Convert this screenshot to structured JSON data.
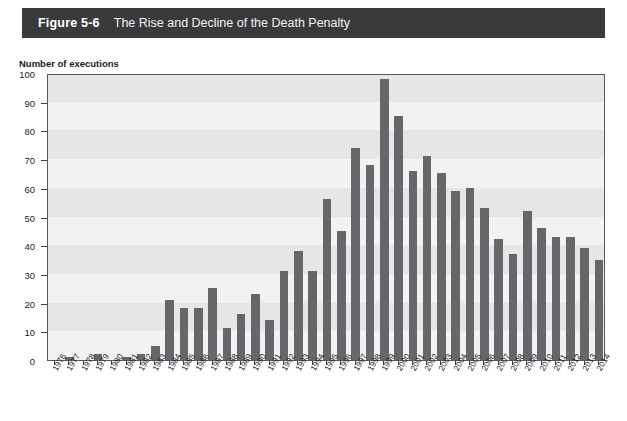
{
  "header": {
    "figure_number": "Figure 5-6",
    "title": "The Rise and Decline of the Death Penalty",
    "bar_color": "#3a3a3c",
    "text_color": "#ffffff"
  },
  "chart_data": {
    "type": "bar",
    "title": "The Rise and Decline of the Death Penalty",
    "xlabel": "",
    "ylabel": "Number of executions",
    "ylim": [
      0,
      100
    ],
    "ytick_step": 10,
    "yticks": [
      0,
      10,
      20,
      30,
      40,
      50,
      60,
      70,
      80,
      90,
      100
    ],
    "grid": false,
    "legend": null,
    "bar_color": "#66666b",
    "plot_background": "#f2f2f2",
    "band_color": "#e6e6e6",
    "categories": [
      "1976",
      "1977",
      "1978",
      "1979",
      "1980",
      "1981",
      "1982",
      "1983",
      "1984",
      "1985",
      "1986",
      "1987",
      "1988",
      "1989",
      "1990",
      "1991",
      "1992",
      "1993",
      "1994",
      "1995",
      "1996",
      "1997",
      "1998",
      "1999",
      "2000",
      "2001",
      "2002",
      "2003",
      "2004",
      "2005",
      "2006",
      "2007",
      "2008",
      "2009",
      "2010",
      "2011",
      "2012",
      "2013",
      "2014"
    ],
    "values": [
      0,
      1,
      0,
      2,
      0,
      1,
      2,
      5,
      21,
      18,
      18,
      25,
      11,
      16,
      23,
      14,
      31,
      38,
      31,
      56,
      45,
      74,
      68,
      98,
      85,
      66,
      71,
      65,
      59,
      60,
      53,
      42,
      37,
      52,
      46,
      43,
      43,
      39,
      35
    ]
  }
}
